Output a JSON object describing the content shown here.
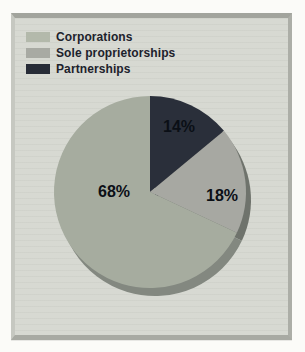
{
  "chart_data": {
    "type": "pie",
    "title": "",
    "unit": "percent",
    "direction": "clockwise",
    "start_angle_deg": 0,
    "style": "3d-depth",
    "slices": [
      {
        "label": "Partnerships",
        "value": 14,
        "pct_label": "14%",
        "color": "#2a2f3a",
        "side_color": "#191d26"
      },
      {
        "label": "Sole proprietorships",
        "value": 18,
        "pct_label": "18%",
        "color": "#a7a8a2",
        "side_color": "#6f736c"
      },
      {
        "label": "Corporations",
        "value": 68,
        "pct_label": "68%",
        "color": "#a6ac9f",
        "side_color": "#838880"
      }
    ],
    "legend_position": "top-left",
    "legend": [
      {
        "label": "Corporations",
        "swatch_color": "#b3b9ab"
      },
      {
        "label": "Sole proprietorships",
        "swatch_color": "#a8aaa3"
      },
      {
        "label": "Partnerships",
        "swatch_color": "#272c37"
      }
    ]
  },
  "colors": {
    "page_bg": "#fbfbf8",
    "panel_bg": "#d6d8d1",
    "bevel_top": "#a2a49d",
    "bevel_left": "#c6c8c1",
    "bevel_right": "#acaea7",
    "bevel_bottom": "#a8aaa3",
    "legend_text": "#1d222c",
    "pct_text": "#0b0f16"
  }
}
